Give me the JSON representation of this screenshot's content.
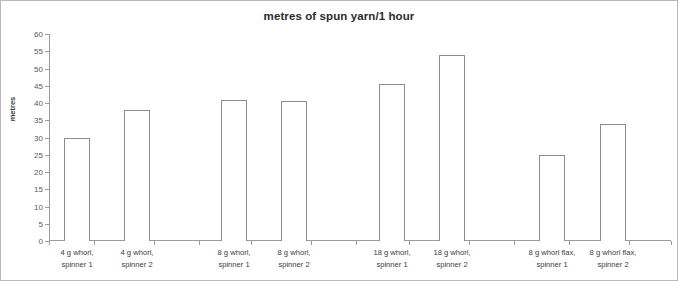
{
  "chart_data": {
    "type": "bar",
    "title": "metres of spun yarn/1 hour",
    "xlabel": "",
    "ylabel": "metres",
    "ylim": [
      0,
      60
    ],
    "ytick_step": 5,
    "yticks": [
      0,
      5,
      10,
      15,
      20,
      25,
      30,
      35,
      40,
      45,
      50,
      55,
      60
    ],
    "grid": false,
    "legend": false,
    "bar_style": {
      "fill": "#ffffff",
      "border": "#8c8c8c"
    },
    "categories": [
      "4 g whorl, spinner 1",
      "4 g whorl, spinner 2",
      "8 g whorl, spinner 1",
      "8 g whorl, spinner 2",
      "18 g whorl, spinner 1",
      "18 g whorl, spinner 2",
      "8 g whorl flax, spinner 1",
      "8 g whorl flax, spinner 2"
    ],
    "category_lines": [
      [
        "4 g whorl,",
        "spinner 1"
      ],
      [
        "4 g whorl,",
        "spinner 2"
      ],
      [
        "8 g whorl,",
        "spinner 1"
      ],
      [
        "8 g whorl,",
        "spinner 2"
      ],
      [
        "18 g whorl,",
        "spinner 1"
      ],
      [
        "18 g whorl,",
        "spinner 2"
      ],
      [
        "8 g whorl flax,",
        "spinner 1"
      ],
      [
        "8 g whorl flax,",
        "spinner 2"
      ]
    ],
    "values": [
      30,
      38,
      41,
      40.5,
      45.5,
      54,
      25,
      34
    ]
  }
}
